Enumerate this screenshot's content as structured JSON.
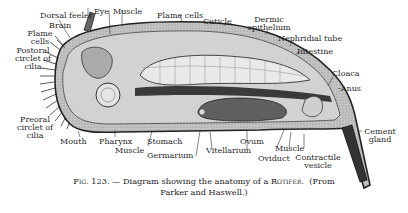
{
  "figure": {
    "number": "Fig. 123.",
    "title": "Diagram showing the anatomy of a Rotifer.",
    "caption_line1_prefix": "Fig. 123.",
    "caption_line1_text": "— Diagram showing the anatomy of a",
    "caption_line1_subject": "Rotifer.",
    "caption_line1_source_open": "(From",
    "caption_line2": "Parker and Haswell.)"
  },
  "labels": {
    "dorsal_feeler": "Dorsal feeler",
    "eye": "Eye",
    "muscle_top": "Muscle",
    "flame_cells_top": "Flame cells",
    "cuticle": "Cuticle",
    "dermic_1": "Dermic",
    "dermic_2": "epithelium",
    "brain": "Brain",
    "flame_1": "Flame",
    "flame_2": "cells",
    "nephridial_tube": "Nephridial tube",
    "postoral_1": "Postoral",
    "postoral_2": "circlet of",
    "postoral_3": "cilia",
    "intestine": "Intestine",
    "cloaca": "Cloaca",
    "anus": "-Anus",
    "preoral_1": "Preoral",
    "preoral_2": "circlet of",
    "preoral_3": "cilia",
    "mouth": "Mouth",
    "pharynx": "Pharynx",
    "muscle_bottom": "Muscle",
    "stomach": "Stomach",
    "germarium": "Germarium",
    "vitellarium": "Vitellarium",
    "ovum": "Ovum",
    "oviduct": "Oviduct",
    "muscle_right": "Muscle",
    "contractile_1": "Contractile",
    "contractile_2": "vesicle",
    "cement_1": "Cement",
    "cement_2": "gland"
  },
  "colors": {
    "ink": "#1a1a1a",
    "body_fill": "#b9b9b9",
    "cavity_fill": "#d6d6d6",
    "organ_fill": "#e8e8e8",
    "dark_organ": "#555555",
    "background": "#ffffff"
  }
}
